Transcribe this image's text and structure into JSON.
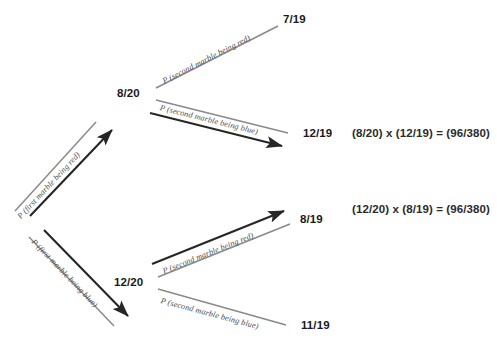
{
  "diagram": {
    "colors": {
      "arrow": "#262626",
      "label_line": "#8a8a8a",
      "text": "#1a1a1a",
      "label_text": "#4d4d4d",
      "background": "#ffffff"
    },
    "root": {
      "branches": [
        {
          "label": "P (first marble being red)",
          "node": "8/20",
          "children": [
            {
              "label": "P (second marble being red)",
              "node": "7/19"
            },
            {
              "label": "P (second marble being blue)",
              "node": "12/19"
            }
          ]
        },
        {
          "label": "P (first marble being blue)",
          "node": "12/20",
          "children": [
            {
              "label": "P (second marble being red)",
              "node": "8/19"
            },
            {
              "label": "P (second marble being blue)",
              "node": "11/19"
            }
          ]
        }
      ]
    },
    "products": [
      "(8/20) x (12/19) = (96/380)",
      "(12/20) x (8/19) = (96/380)"
    ]
  }
}
